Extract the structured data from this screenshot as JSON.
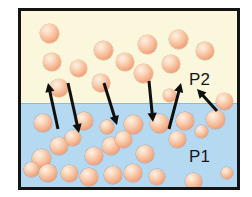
{
  "figure": {
    "frame": {
      "border_color": "#141414",
      "border_width_px": 3
    },
    "phases": [
      {
        "id": "gas",
        "name": "vapor-phase",
        "label": "P2",
        "background_color": "#faf7dc",
        "region": {
          "x": 0,
          "y": 0,
          "width": 216,
          "height": 92
        }
      },
      {
        "id": "liquid",
        "name": "liquid-phase",
        "label": "P1",
        "background_color": "#b5d9f0",
        "region": {
          "x": 0,
          "y": 92,
          "width": 216,
          "height": 84
        }
      }
    ],
    "interface_y": 92,
    "molecule": {
      "semantic_name": "molecule-sphere",
      "fill_highlight": "#fff1e4",
      "fill_mid": "#f6b792",
      "fill_edge": "#e07f5a",
      "count_gas": 14,
      "count_liquid": 25,
      "default_diameter_px": 17
    },
    "arrow": {
      "color": "#101010",
      "stroke_width_px": 3,
      "head_length_px": 9
    },
    "molecules_gas": [
      {
        "cx": 28,
        "cy": 22,
        "r": 9.5
      },
      {
        "cx": 31,
        "cy": 51,
        "r": 9.0
      },
      {
        "cx": 57,
        "cy": 57,
        "r": 8.5
      },
      {
        "cx": 38,
        "cy": 77,
        "r": 9.0
      },
      {
        "cx": 80,
        "cy": 72,
        "r": 9.0
      },
      {
        "cx": 82,
        "cy": 39,
        "r": 9.5
      },
      {
        "cx": 104,
        "cy": 51,
        "r": 9.0
      },
      {
        "cx": 122,
        "cy": 62,
        "r": 9.5
      },
      {
        "cx": 126,
        "cy": 33,
        "r": 9.5
      },
      {
        "cx": 150,
        "cy": 53,
        "r": 9.0
      },
      {
        "cx": 157,
        "cy": 28,
        "r": 9.5
      },
      {
        "cx": 184,
        "cy": 40,
        "r": 9.0
      },
      {
        "cx": 148,
        "cy": 84,
        "r": 6.5
      },
      {
        "cx": 203,
        "cy": 90,
        "r": 8.5
      }
    ],
    "molecules_liquid": [
      {
        "cx": 22,
        "cy": 112,
        "r": 9.0
      },
      {
        "cx": 63,
        "cy": 110,
        "r": 9.0
      },
      {
        "cx": 112,
        "cy": 113,
        "r": 9.5
      },
      {
        "cx": 138,
        "cy": 112,
        "r": 9.5
      },
      {
        "cx": 164,
        "cy": 110,
        "r": 9.0
      },
      {
        "cx": 194,
        "cy": 108,
        "r": 9.5
      },
      {
        "cx": 156,
        "cy": 128,
        "r": 8.5
      },
      {
        "cx": 38,
        "cy": 135,
        "r": 9.0
      },
      {
        "cx": 90,
        "cy": 135,
        "r": 9.0
      },
      {
        "cx": 102,
        "cy": 128,
        "r": 8.5
      },
      {
        "cx": 20,
        "cy": 147,
        "r": 9.5
      },
      {
        "cx": 73,
        "cy": 145,
        "r": 9.0
      },
      {
        "cx": 124,
        "cy": 143,
        "r": 9.0
      },
      {
        "cx": 27,
        "cy": 162,
        "r": 9.0
      },
      {
        "cx": 48,
        "cy": 162,
        "r": 8.5
      },
      {
        "cx": 68,
        "cy": 166,
        "r": 9.0
      },
      {
        "cx": 92,
        "cy": 164,
        "r": 9.0
      },
      {
        "cx": 112,
        "cy": 162,
        "r": 9.0
      },
      {
        "cx": 136,
        "cy": 166,
        "r": 8.0
      },
      {
        "cx": 172,
        "cy": 170,
        "r": 8.5
      },
      {
        "cx": 52,
        "cy": 127,
        "r": 8.0
      },
      {
        "cx": 86,
        "cy": 116,
        "r": 7.0
      },
      {
        "cx": 10,
        "cy": 158,
        "r": 7.5
      },
      {
        "cx": 180,
        "cy": 120,
        "r": 6.5
      },
      {
        "cx": 206,
        "cy": 162,
        "r": 6.0
      }
    ],
    "arrows": [
      {
        "name": "evaporation-arrow-1",
        "direction": "up",
        "x1": 37,
        "y1": 118,
        "x2": 27,
        "y2": 72
      },
      {
        "name": "condensation-arrow-1",
        "direction": "down",
        "x1": 47,
        "y1": 72,
        "x2": 58,
        "y2": 122
      },
      {
        "name": "condensation-arrow-2",
        "direction": "down",
        "x1": 83,
        "y1": 72,
        "x2": 96,
        "y2": 114
      },
      {
        "name": "condensation-arrow-3",
        "direction": "down",
        "x1": 128,
        "y1": 70,
        "x2": 132,
        "y2": 111
      },
      {
        "name": "evaporation-arrow-2",
        "direction": "up",
        "x1": 148,
        "y1": 118,
        "x2": 160,
        "y2": 72
      },
      {
        "name": "pressure-pointer-p2",
        "direction": "up",
        "x1": 196,
        "y1": 100,
        "x2": 176,
        "y2": 78
      }
    ],
    "labels": {
      "p2": "P2",
      "p1": "P1",
      "text_color": "#15161c"
    }
  }
}
